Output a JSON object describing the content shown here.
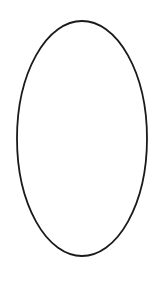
{
  "diagram": {
    "background": "#ffffff",
    "shapes": [
      {
        "type": "ellipse",
        "cx": 82,
        "cy": 138.5,
        "rx": 65,
        "ry": 117.5,
        "stroke": "#1a1a1a",
        "stroke_width": 1.8,
        "fill": "none"
      }
    ]
  }
}
